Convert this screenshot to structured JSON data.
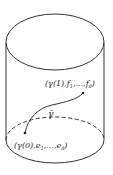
{
  "diagram": {
    "shape": "cylinder",
    "colors": {
      "stroke": "#333333",
      "background": "#ffffff"
    },
    "labels": {
      "top_point": "(γ(1),f",
      "top_point_sub1": "1",
      "top_point_mid": ",...,f",
      "top_point_subd": "d",
      "top_point_close": ")",
      "path": "γ̄",
      "bottom_point": "(γ(0),e",
      "bottom_point_sub1": "1",
      "bottom_point_mid": ",...,e",
      "bottom_point_subd": "d",
      "bottom_point_close": ")"
    }
  }
}
